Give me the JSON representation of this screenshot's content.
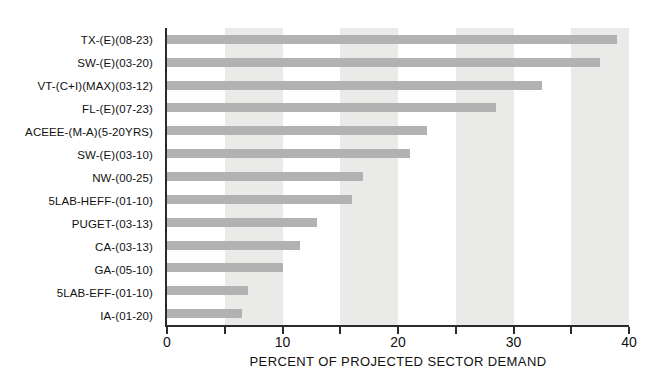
{
  "chart_data": {
    "type": "bar",
    "orientation": "horizontal",
    "title": "",
    "xlabel": "PERCENT OF PROJECTED SECTOR DEMAND",
    "ylabel": "",
    "xlim": [
      0,
      40
    ],
    "x_major_ticks": [
      0,
      10,
      20,
      30,
      40
    ],
    "x_minor_ticks": [
      5,
      15,
      25,
      35
    ],
    "shaded_bands": [
      [
        5,
        10
      ],
      [
        15,
        20
      ],
      [
        25,
        30
      ],
      [
        35,
        40
      ]
    ],
    "grid": false,
    "legend_position": "none",
    "categories": [
      "TX-(E)(08-23)",
      "SW-(E)(03-20)",
      "VT-(C+I)(MAX)(03-12)",
      "FL-(E)(07-23)",
      "ACEEE-(M-A)(5-20YRS)",
      "SW-(E)(03-10)",
      "NW-(00-25)",
      "5LAB-HEFF-(01-10)",
      "PUGET-(03-13)",
      "CA-(03-13)",
      "GA-(05-10)",
      "5LAB-EFF-(01-10)",
      "IA-(01-20)"
    ],
    "values": [
      39,
      37.5,
      32.5,
      28.5,
      22.5,
      21,
      17,
      16,
      13,
      11.5,
      10,
      7,
      6.5
    ],
    "colors": {
      "bar": "#b2b2b2",
      "band": "#eaeae8",
      "axis": "#2b2b2b",
      "text": "#111111",
      "background": "#ffffff"
    }
  }
}
